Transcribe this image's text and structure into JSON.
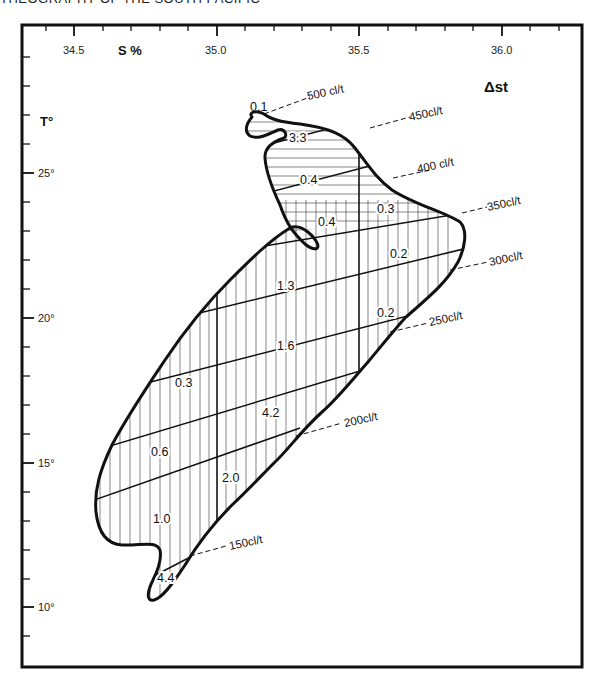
{
  "header": {
    "caption_fragment": "THEOGRAPHY OF THE SOUTH PACIFIC"
  },
  "diagram": {
    "type": "T-S diagram",
    "x_axis": {
      "title": "S %",
      "ticks": [
        "34.5",
        "35.0",
        "35.5",
        "36.0"
      ]
    },
    "y_axis": {
      "title": "T°",
      "ticks": [
        "25°",
        "20°",
        "15°",
        "10°"
      ]
    },
    "legend_title": "Δst",
    "isolines": [
      {
        "label": "500 cl/t"
      },
      {
        "label": "450cl/t"
      },
      {
        "label": "400 cl/t"
      },
      {
        "label": "350cl/t"
      },
      {
        "label": "300cl/t"
      },
      {
        "label": "250cl/t"
      },
      {
        "label": "200cl/t"
      },
      {
        "label": "150cl/t"
      }
    ],
    "cell_values": [
      {
        "id": "c01",
        "value": "0.1"
      },
      {
        "id": "c02",
        "value": "3.3"
      },
      {
        "id": "c03",
        "value": "0.4"
      },
      {
        "id": "c04",
        "value": "0.4"
      },
      {
        "id": "c05",
        "value": "0.3"
      },
      {
        "id": "c06",
        "value": "0.2"
      },
      {
        "id": "c07",
        "value": "1.3"
      },
      {
        "id": "c08",
        "value": "0.2"
      },
      {
        "id": "c09",
        "value": "1.6"
      },
      {
        "id": "c10",
        "value": "0.3"
      },
      {
        "id": "c11",
        "value": "4.2"
      },
      {
        "id": "c12",
        "value": "0.6"
      },
      {
        "id": "c13",
        "value": "2.0"
      },
      {
        "id": "c14",
        "value": "1.0"
      },
      {
        "id": "c15",
        "value": "4.4"
      }
    ]
  }
}
